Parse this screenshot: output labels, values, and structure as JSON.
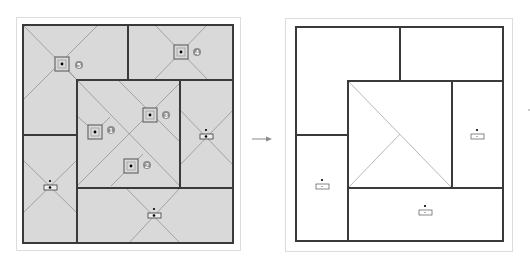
{
  "figure": {
    "type": "floor-plan-transformation",
    "arrow": "right-arrow",
    "colors": {
      "wall": "#3a3a3a",
      "fill_left": "#d9d9d9",
      "fill_right": "#ffffff",
      "diagonal": "#8a8a8a",
      "badge": "#8c8c8c",
      "badge_text": "#ffffff",
      "panel_border": "#dcdcdc"
    }
  },
  "left_panel": {
    "title": "before",
    "rooms": [
      {
        "id": "top-left-room",
        "rect": [
          23,
          25,
          105,
          110
        ]
      },
      {
        "id": "top-right-room",
        "rect": [
          128,
          25,
          105,
          55
        ]
      },
      {
        "id": "center-room",
        "rect": [
          77,
          80,
          103,
          108
        ]
      },
      {
        "id": "right-room",
        "rect": [
          180,
          80,
          53,
          108
        ]
      },
      {
        "id": "left-bottom-room",
        "rect": [
          23,
          135,
          54,
          108
        ]
      },
      {
        "id": "bottom-room",
        "rect": [
          77,
          188,
          156,
          55
        ]
      }
    ],
    "skylights": [
      {
        "number": "1",
        "x": 95,
        "y": 132
      },
      {
        "number": "2",
        "x": 131,
        "y": 166
      },
      {
        "number": "3",
        "x": 150,
        "y": 115
      },
      {
        "number": "4",
        "x": 181,
        "y": 52
      },
      {
        "number": "5",
        "x": 62,
        "y": 64
      }
    ],
    "fixtures": [
      {
        "id": "right-room-fixture",
        "x": 206,
        "y": 137
      },
      {
        "id": "left-bottom-fixture",
        "x": 50,
        "y": 188
      },
      {
        "id": "bottom-room-fixture",
        "x": 154,
        "y": 215
      }
    ]
  },
  "right_panel": {
    "title": "after",
    "rooms": [
      {
        "id": "top-left-room",
        "rect": [
          296,
          27,
          104,
          108
        ]
      },
      {
        "id": "top-right-room",
        "rect": [
          400,
          27,
          103,
          54
        ]
      },
      {
        "id": "center-room",
        "rect": [
          348,
          81,
          104,
          107
        ]
      },
      {
        "id": "right-room",
        "rect": [
          452,
          81,
          51,
          107
        ]
      },
      {
        "id": "left-bottom-room",
        "rect": [
          296,
          135,
          52,
          106
        ]
      },
      {
        "id": "bottom-room",
        "rect": [
          348,
          188,
          155,
          53
        ]
      }
    ],
    "fixtures": [
      {
        "id": "right-room-fixture",
        "x": 477,
        "y": 137
      },
      {
        "id": "left-bottom-fixture",
        "x": 322,
        "y": 187
      },
      {
        "id": "bottom-room-fixture",
        "x": 425,
        "y": 213
      }
    ]
  }
}
